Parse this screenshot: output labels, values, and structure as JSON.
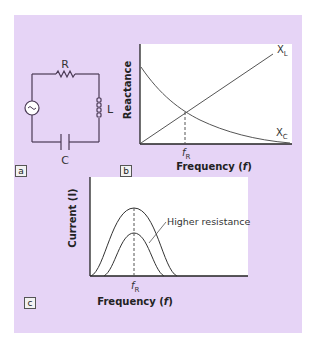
{
  "panel_a": {
    "tag": "a",
    "labels": {
      "resistor": "R",
      "inductor": "L",
      "capacitor": "C"
    },
    "icons": [
      "ac-source-icon",
      "resistor-icon",
      "inductor-icon",
      "capacitor-icon"
    ]
  },
  "panel_b": {
    "tag": "b",
    "ylabel": "Reactance",
    "xlabel": "Frequency (f)",
    "xlabel_main": "Frequency (",
    "xlabel_var": "f",
    "xlabel_end": ")",
    "marker": "f",
    "marker_sub": "R",
    "series_labels": {
      "xl": "X",
      "xl_sub": "L",
      "xc": "X",
      "xc_sub": "C"
    }
  },
  "panel_c": {
    "tag": "c",
    "ylabel": "Current (I)",
    "xlabel_main": "Frequency (",
    "xlabel_var": "f",
    "xlabel_end": ")",
    "marker": "f",
    "marker_sub": "R",
    "annotation": "Higher resistance"
  },
  "colors": {
    "background": "#e6d4f6",
    "plot": "#ffffff",
    "line": "#333333"
  }
}
